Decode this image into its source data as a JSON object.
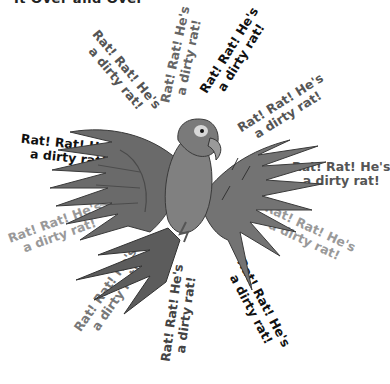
{
  "header": {
    "clipped_text": "It Over and Over"
  },
  "phrase": {
    "line1": "Rat! Rat! He's",
    "line2": "a dirty rat!"
  },
  "phrases": [
    {
      "id": "p1",
      "line1": "Rat! Rat! He's",
      "line2": "a dirty rat!",
      "color": "#555555",
      "x": 72,
      "y": 60,
      "angle": 50
    },
    {
      "id": "p2",
      "line1": "Rat! Rat! He's",
      "line2": "a dirty rat!",
      "color": "#666666",
      "x": 133,
      "y": 42,
      "angle": -78
    },
    {
      "id": "p3",
      "line1": "Rat! Rat! He's",
      "line2": "a dirty rat!",
      "color": "#111111",
      "x": 186,
      "y": 40,
      "angle": -58
    },
    {
      "id": "p4",
      "line1": "Rat! Rat! He's",
      "line2": "a dirty rat!",
      "color": "#555555",
      "x": 235,
      "y": 95,
      "angle": -32
    },
    {
      "id": "p5",
      "line1": "Rat! Rat! He's",
      "line2": "a dirty rat!",
      "color": "#555555",
      "x": 292,
      "y": 160,
      "angle": 0
    },
    {
      "id": "p6",
      "line1": "Rat! Rat! He's",
      "line2": "a dirty rat!",
      "color": "#999999",
      "x": 258,
      "y": 220,
      "angle": 25
    },
    {
      "id": "p7",
      "line1": "Rat! Rat! He's",
      "line2": "a dirty rat!",
      "color": "#111111",
      "x": 208,
      "y": 292,
      "angle": 62
    },
    {
      "id": "p8",
      "line1": "Rat! Rat! He's",
      "line2": "a dirty rat!",
      "color": "#444444",
      "x": 130,
      "y": 300,
      "angle": -82
    },
    {
      "id": "p9",
      "line1": "Rat! Rat! He's",
      "line2": "a dirty rat!",
      "color": "#777777",
      "x": 62,
      "y": 280,
      "angle": -55
    },
    {
      "id": "p10",
      "line1": "Rat! Rat! He's",
      "line2": "a dirty rat!",
      "color": "#999999",
      "x": 8,
      "y": 215,
      "angle": -20
    },
    {
      "id": "p11",
      "line1": "Rat! Rat! He's",
      "line2": "a dirty rat!",
      "color": "#111111",
      "x": 20,
      "y": 137,
      "angle": 6
    }
  ],
  "illustration": {
    "subject": "parrot",
    "palette": {
      "body": "#6e6e6e",
      "dark": "#3e3e3e",
      "light": "#9a9a9a",
      "eye": "#d8d8d8"
    }
  }
}
